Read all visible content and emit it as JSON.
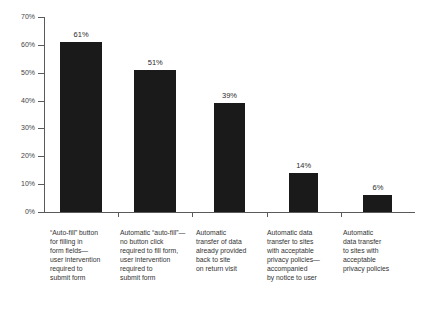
{
  "chart_data": {
    "type": "bar",
    "title": "",
    "subtitle": "",
    "xlabel": "",
    "ylabel": "",
    "ylim": [
      0,
      70
    ],
    "ytick_labels": [
      "0%",
      "10%",
      "20%",
      "30%",
      "40%",
      "50%",
      "60%",
      "70%"
    ],
    "ytick_values": [
      0,
      10,
      20,
      30,
      40,
      50,
      60,
      70
    ],
    "grid": false,
    "legend": null,
    "value_label_suffix": "%",
    "bar_color": "#1a1a1a",
    "axis_color": "#5a5a5a",
    "text_color": "#333333",
    "background": "#ffffff",
    "categories": [
      "“Auto-fill” button for filling in form fields—user intervention required to submit form",
      "Automatic “auto-fill”—no button click required to fill form, user intervention required to submit form",
      "Automatic transfer of data already provided back to site on return visit",
      "Automatic data transfer to sites with acceptable privacy policies—accompanied by notice to user",
      "Automatic data transfer to sites with acceptable privacy policies"
    ],
    "category_lines": [
      [
        "“Auto-fill” button",
        "for filling in",
        "form fields—",
        "user intervention",
        "required to",
        "submit form"
      ],
      [
        "Automatic “auto-fill”—",
        "no button click",
        "required to fill form,",
        "user intervention",
        "required to",
        "submit form"
      ],
      [
        "Automatic",
        "transfer of data",
        "already provided",
        "back to site",
        "on return visit"
      ],
      [
        "Automatic data",
        "transfer to sites",
        "with acceptable",
        "privacy policies—",
        "accompanied",
        "by notice to user"
      ],
      [
        "Automatic",
        "data transfer",
        "to sites with",
        "acceptable",
        "privacy policies"
      ]
    ],
    "values": [
      61,
      51,
      39,
      14,
      6
    ],
    "value_labels": [
      "61%",
      "51%",
      "39%",
      "14%",
      "6%"
    ]
  }
}
